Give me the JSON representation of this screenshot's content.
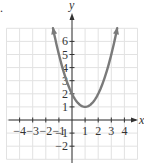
{
  "chart_data": {
    "type": "line",
    "title": "",
    "xlabel": "x",
    "ylabel": "y",
    "xlim": [
      -5,
      5
    ],
    "ylim": [
      -3,
      7
    ],
    "grid": true,
    "x_ticks": [
      -4,
      -3,
      -2,
      -1,
      1,
      2,
      3,
      4
    ],
    "y_ticks": [
      -2,
      -1,
      1,
      2,
      3,
      4,
      5,
      6
    ],
    "x_tick_labels": [
      "−4",
      "−3",
      "−2",
      "−1",
      "1",
      "2",
      "3",
      "4"
    ],
    "y_tick_labels": [
      "−2",
      "−1",
      "1",
      "2",
      "3",
      "4",
      "5",
      "6"
    ],
    "series": [
      {
        "name": "parabola",
        "equation": "y = (x - 1)^2 + 1",
        "vertex": [
          1,
          1
        ],
        "x": [
          -1.45,
          -1,
          0,
          1,
          2,
          3,
          3.45
        ],
        "values": [
          7.0,
          5,
          2,
          1,
          2,
          5,
          7.0
        ],
        "arrows_at_ends": true
      }
    ],
    "colors": {
      "curve": "#7a7a7a",
      "axes": "#333333",
      "grid": "#e2e2e2"
    }
  },
  "labels": {
    "x_axis": "x",
    "y_axis": "y",
    "corner_mark": "."
  }
}
